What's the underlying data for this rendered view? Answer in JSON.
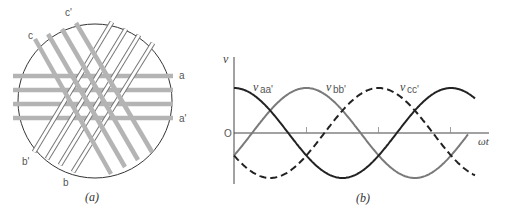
{
  "figure_a": {
    "caption": "(a)",
    "labels": {
      "a": "a",
      "a_prime": "a'",
      "b": "b",
      "b_prime": "b'",
      "c": "c",
      "c_prime": "c'"
    },
    "colors": {
      "phase_a_bars": "#b4b4b4",
      "phase_c_bars": "#b4b4b4",
      "phase_b_bars_outline": "#777777",
      "circle": "#333333"
    }
  },
  "figure_b": {
    "caption": "(b)",
    "y_axis_label": "v",
    "x_axis_label": "ωt",
    "origin_label": "O",
    "series_labels": {
      "vaa": {
        "base": "v",
        "sub": "aa'"
      },
      "vbb": {
        "base": "v",
        "sub": "bb'"
      },
      "vcc": {
        "base": "v",
        "sub": "cc'"
      }
    },
    "colors": {
      "vaa": "#222222",
      "vbb": "#7a7a7a",
      "vcc": "#222222"
    }
  },
  "chart_data": {
    "type": "line",
    "title": "",
    "xlabel": "ωt",
    "ylabel": "v",
    "x_ticks_deg": [
      0,
      120,
      240,
      360
    ],
    "x_range_deg": [
      0,
      435
    ],
    "series": [
      {
        "name": "v_aa'",
        "formula": "cos(ωt)",
        "phase_deg": 0,
        "style": "solid-black"
      },
      {
        "name": "v_bb'",
        "formula": "cos(ωt-120°)",
        "phase_deg": -120,
        "style": "solid-gray"
      },
      {
        "name": "v_cc'",
        "formula": "cos(ωt-240°)",
        "phase_deg": -240,
        "style": "dashed-black"
      }
    ]
  }
}
